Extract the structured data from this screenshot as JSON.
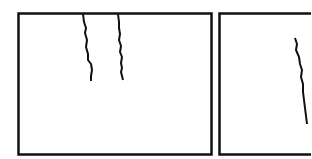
{
  "figure": {
    "panels": [
      {
        "id": "left-panel",
        "cracks": 2
      },
      {
        "id": "right-panel",
        "cracks": 1
      }
    ],
    "colors": {
      "stroke": "#111111",
      "background": "#ffffff"
    }
  }
}
